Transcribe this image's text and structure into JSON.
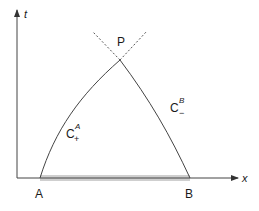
{
  "diagram": {
    "axes": {
      "vertical_label": "t",
      "horizontal_label": "x"
    },
    "points": {
      "A": "A",
      "B": "B",
      "P": "P"
    },
    "curves": [
      {
        "name": "C",
        "subscript": "+",
        "superscript": "A",
        "from": "A",
        "to": "P"
      },
      {
        "name": "C",
        "subscript": "−",
        "superscript": "B",
        "from": "B",
        "to": "P"
      }
    ],
    "shaded_interval": {
      "from": "A",
      "to": "B",
      "color": "#c8c8c8"
    },
    "line_color": "#3a3a3a"
  }
}
